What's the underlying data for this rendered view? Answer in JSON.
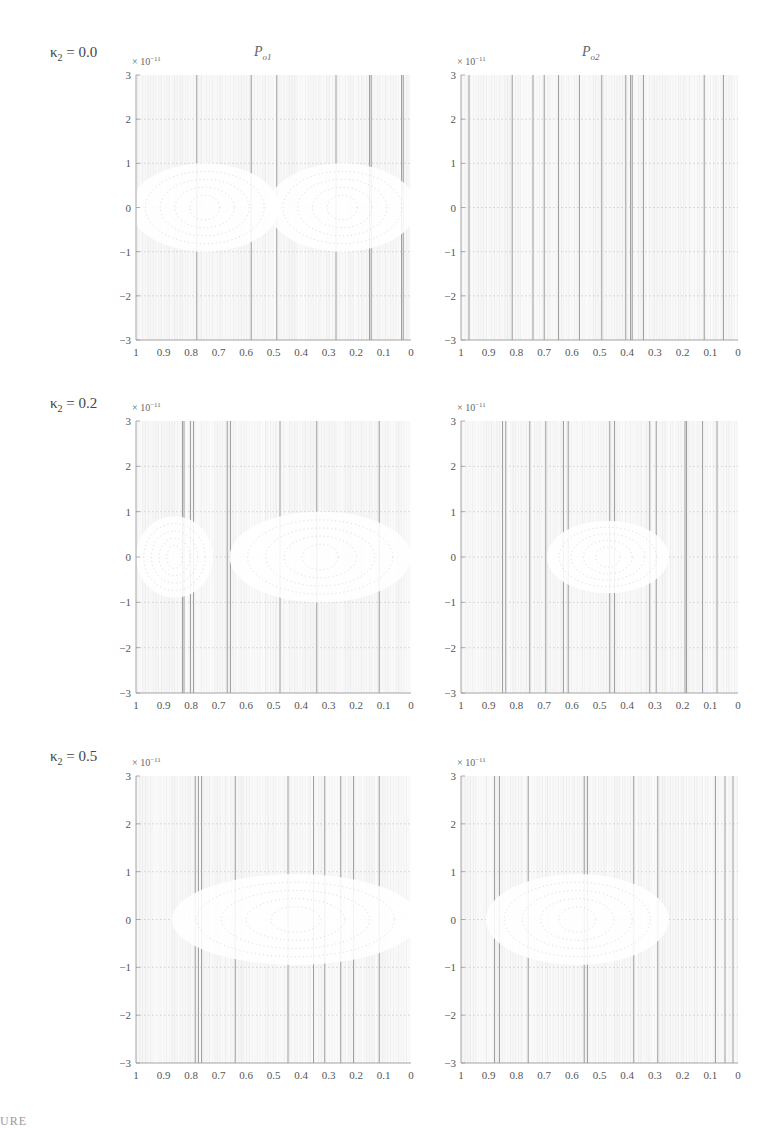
{
  "figure": {
    "columns": [
      {
        "title_main": "P",
        "title_sub": "o1"
      },
      {
        "title_main": "P",
        "title_sub": "o2"
      }
    ],
    "exponent_label": {
      "prefix": "× 10",
      "power": "−11"
    },
    "rows": [
      {
        "kappa_symbol": "κ",
        "kappa_sub": "2",
        "kappa_value": "= 0.0"
      },
      {
        "kappa_symbol": "κ",
        "kappa_sub": "2",
        "kappa_value": "= 0.2"
      },
      {
        "kappa_symbol": "κ",
        "kappa_sub": "2",
        "kappa_value": "= 0.5"
      }
    ],
    "caption_fragment": "URE"
  },
  "layout": {
    "rows_y": [
      {
        "top": 75,
        "bottom": 340
      },
      {
        "top": 421,
        "bottom": 693
      },
      {
        "top": 776,
        "bottom": 1063
      }
    ],
    "cols_x": [
      {
        "left": 136,
        "right": 411
      },
      {
        "left": 461,
        "right": 738
      }
    ],
    "colors": {
      "grid_dark": "#8a8a8a",
      "grid_light": "#d4d4d4",
      "axis": "#9a9a9a",
      "text": "#555555"
    }
  },
  "chart_data": [
    {
      "type": "heatmap",
      "title": "P_o1 (κ2 = 0.0)",
      "xlabel": "",
      "ylabel": "",
      "xlim": [
        1,
        0
      ],
      "ylim": [
        -3e-11,
        3e-11
      ],
      "x_ticks": [
        "1",
        "0.9",
        "0.8",
        "0.7",
        "0.6",
        "0.5",
        "0.4",
        "0.3",
        "0.2",
        "0.1",
        "0"
      ],
      "y_ticks": [
        "3",
        "2",
        "1",
        "0",
        "−1",
        "−2",
        "−3"
      ],
      "y_scale": "× 10^−11",
      "grid": true,
      "white_regions": [
        {
          "shape": "hyperbola-left",
          "cx": 0.75,
          "cy": 0,
          "rx": 0.27,
          "ry": 1e-11
        },
        {
          "shape": "hyperbola-right",
          "cx": 0.25,
          "cy": 0,
          "rx": 0.27,
          "ry": 1e-11
        }
      ],
      "notes": "Symmetric bow-shaped contour bands about x=0.5 within |y| < 1e-11"
    },
    {
      "type": "heatmap",
      "title": "P_o2 (κ2 = 0.0)",
      "xlim": [
        1,
        0
      ],
      "ylim": [
        -3e-11,
        3e-11
      ],
      "x_ticks": [
        "1",
        "0.9",
        "0.8",
        "0.7",
        "0.6",
        "0.5",
        "0.4",
        "0.3",
        "0.2",
        "0.1",
        "0"
      ],
      "y_ticks": [
        "3",
        "2",
        "1",
        "0",
        "−1",
        "−2",
        "−3"
      ],
      "y_scale": "× 10^−11",
      "grid": true,
      "white_regions": [],
      "notes": "Nearly uniform field; dotted horizontal gridlines at integer y"
    },
    {
      "type": "heatmap",
      "title": "P_o1 (κ2 = 0.2)",
      "xlim": [
        1,
        0
      ],
      "ylim": [
        -3e-11,
        3e-11
      ],
      "x_ticks": [
        "1",
        "0.9",
        "0.8",
        "0.7",
        "0.6",
        "0.5",
        "0.4",
        "0.3",
        "0.2",
        "0.1",
        "0"
      ],
      "y_ticks": [
        "3",
        "2",
        "1",
        "0",
        "−1",
        "−2",
        "−3"
      ],
      "y_scale": "× 10^−11",
      "grid": true,
      "white_regions": [
        {
          "shape": "ellipse",
          "cx": 0.86,
          "cy": 0,
          "rx": 0.14,
          "ry": 9e-12
        },
        {
          "shape": "ellipse",
          "cx": 0.33,
          "cy": 0,
          "rx": 0.33,
          "ry": 1e-11
        }
      ],
      "notes": "Contour band pinched near x≈0.72; dense core near x≈0.07"
    },
    {
      "type": "heatmap",
      "title": "P_o2 (κ2 = 0.2)",
      "xlim": [
        1,
        0
      ],
      "ylim": [
        -3e-11,
        3e-11
      ],
      "x_ticks": [
        "1",
        "0.9",
        "0.8",
        "0.7",
        "0.6",
        "0.5",
        "0.4",
        "0.3",
        "0.2",
        "0.1",
        "0"
      ],
      "y_ticks": [
        "3",
        "2",
        "1",
        "0",
        "−1",
        "−2",
        "−3"
      ],
      "y_scale": "× 10^−11",
      "grid": true,
      "white_regions": [
        {
          "shape": "ellipse",
          "cx": 0.47,
          "cy": 0,
          "rx": 0.22,
          "ry": 8e-12
        }
      ],
      "notes": "Faint concentric ellipses centered near x≈0.47, y=0"
    },
    {
      "type": "heatmap",
      "title": "P_o1 (κ2 = 0.5)",
      "xlim": [
        1,
        0
      ],
      "ylim": [
        -3e-11,
        3e-11
      ],
      "x_ticks": [
        "1",
        "0.9",
        "0.8",
        "0.7",
        "0.6",
        "0.5",
        "0.4",
        "0.3",
        "0.2",
        "0.1",
        "0"
      ],
      "y_ticks": [
        "3",
        "2",
        "1",
        "0",
        "−1",
        "−2",
        "−3"
      ],
      "y_scale": "× 10^−11",
      "grid": true,
      "white_regions": [
        {
          "shape": "ellipse",
          "cx": 0.42,
          "cy": 0,
          "rx": 0.45,
          "ry": 9.5e-12
        }
      ],
      "notes": "Large elongated ellipse from x≈0.87 to 0; dense core near x≈0.22"
    },
    {
      "type": "heatmap",
      "title": "P_o2 (κ2 = 0.5)",
      "xlim": [
        1,
        0
      ],
      "ylim": [
        -3e-11,
        3e-11
      ],
      "x_ticks": [
        "1",
        "0.9",
        "0.8",
        "0.7",
        "0.6",
        "0.5",
        "0.4",
        "0.3",
        "0.2",
        "0.1",
        "0"
      ],
      "y_ticks": [
        "3",
        "2",
        "1",
        "0",
        "−1",
        "−2",
        "−3"
      ],
      "y_scale": "× 10^−11",
      "grid": true,
      "white_regions": [
        {
          "shape": "ellipse",
          "cx": 0.58,
          "cy": 0,
          "rx": 0.33,
          "ry": 9.5e-12
        }
      ],
      "notes": "Concentric ellipses centered near x≈0.6, y=0"
    }
  ]
}
